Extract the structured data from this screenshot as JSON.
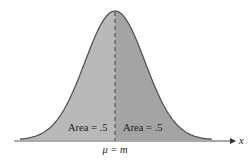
{
  "diagram": {
    "type": "normal-distribution",
    "left_area_label": "Area = .5",
    "right_area_label": "Area = .5",
    "center_label": "μ = m",
    "axis_label": "x",
    "colors": {
      "left_fill": "#b9b9b9",
      "right_fill": "#a4a4a4",
      "outline": "#555555"
    }
  }
}
